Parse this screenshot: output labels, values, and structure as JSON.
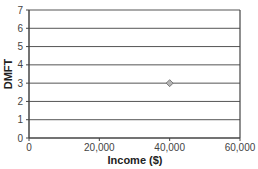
{
  "chart_data": {
    "type": "scatter",
    "title": "",
    "xlabel": "Income ($)",
    "ylabel": "DMFT",
    "xlim": [
      0,
      60000
    ],
    "ylim": [
      0,
      7
    ],
    "x_ticks": [
      0,
      20000,
      40000,
      60000
    ],
    "x_tick_labels": [
      "0",
      "20,000",
      "40,000",
      "60,000"
    ],
    "y_ticks": [
      0,
      1,
      2,
      3,
      4,
      5,
      6,
      7
    ],
    "y_tick_labels": [
      "0",
      "1",
      "2",
      "3",
      "4",
      "5",
      "6",
      "7"
    ],
    "grid": {
      "horizontal": true,
      "vertical": false
    },
    "legend": null,
    "series": [
      {
        "name": "",
        "marker": "diamond",
        "color": "#a0a0a0",
        "points": [
          {
            "x": 40000,
            "y": 3
          }
        ]
      }
    ]
  },
  "colors": {
    "gridline": "#555555",
    "axis": "#444444",
    "marker_fill": "#b5b5b5",
    "marker_stroke": "#666666"
  }
}
